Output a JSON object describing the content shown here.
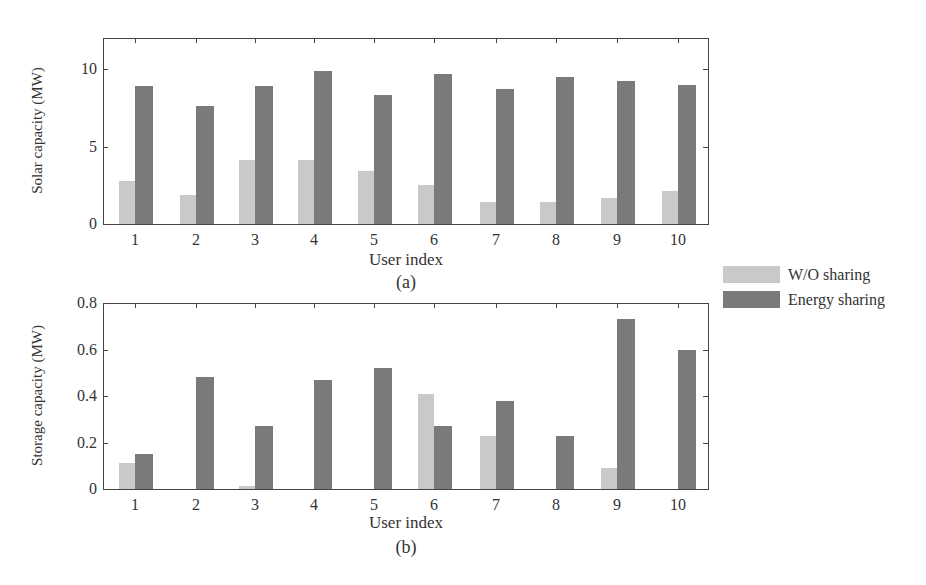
{
  "chart_data": [
    {
      "type": "bar",
      "panel": "(a)",
      "title": "",
      "caption": "(a)",
      "xlabel": "User index",
      "ylabel": "Solar capacity (MW)",
      "categories": [
        "1",
        "2",
        "3",
        "4",
        "5",
        "6",
        "7",
        "8",
        "9",
        "10"
      ],
      "yticks": [
        "0",
        "5",
        "10"
      ],
      "ylim": [
        0,
        12
      ],
      "grid": false,
      "series": [
        {
          "name": "W/O sharing",
          "color": "#c9c9c9",
          "values": [
            2.8,
            1.9,
            4.1,
            4.1,
            3.4,
            2.5,
            1.4,
            1.4,
            1.7,
            2.1
          ]
        },
        {
          "name": "Energy sharing",
          "color": "#7a7a7a",
          "values": [
            8.9,
            7.6,
            8.9,
            9.9,
            8.3,
            9.7,
            8.7,
            9.5,
            9.2,
            9.0
          ]
        }
      ]
    },
    {
      "type": "bar",
      "panel": "(b)",
      "title": "",
      "caption": "(b)",
      "xlabel": "User index",
      "ylabel": "Storage capacity (MW)",
      "categories": [
        "1",
        "2",
        "3",
        "4",
        "5",
        "6",
        "7",
        "8",
        "9",
        "10"
      ],
      "yticks": [
        "0",
        "0.2",
        "0.4",
        "0.6",
        "0.8"
      ],
      "ylim": [
        0,
        0.8
      ],
      "grid": false,
      "series": [
        {
          "name": "W/O sharing",
          "color": "#c9c9c9",
          "values": [
            0.11,
            0.0,
            0.015,
            0.0,
            0.0,
            0.41,
            0.23,
            0.0,
            0.09,
            0.0
          ]
        },
        {
          "name": "Energy sharing",
          "color": "#7a7a7a",
          "values": [
            0.15,
            0.48,
            0.27,
            0.47,
            0.52,
            0.27,
            0.38,
            0.23,
            0.73,
            0.6
          ]
        }
      ]
    }
  ],
  "legend": {
    "position": "right, between panels",
    "items": [
      {
        "label": "W/O sharing",
        "color": "#c9c9c9"
      },
      {
        "label": "Energy sharing",
        "color": "#7a7a7a"
      }
    ]
  }
}
